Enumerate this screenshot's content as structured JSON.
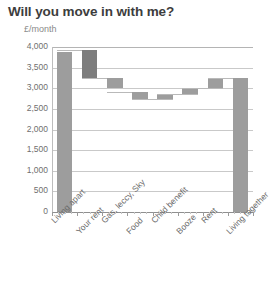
{
  "chart": {
    "title": "Will you move in with me?",
    "subtitle": "£/month"
  },
  "colors": {
    "bar": "#9d9d9d",
    "bar_highlight": "#7d7d7d",
    "gridline": "#c9c9c9",
    "axis": "#8f8f8f",
    "title_text": "#3d3d3d",
    "label_text": "#6b6b6b"
  },
  "chart_data": {
    "type": "bar",
    "subtype": "waterfall",
    "title": "Will you move in with me?",
    "subtitle": "£/month",
    "xlabel": "",
    "ylabel": "£/month",
    "ylim": [
      0,
      4000
    ],
    "ytick_labels": [
      "4,000",
      "3,500",
      "3,000",
      "2,500",
      "2,000",
      "1,500",
      "1,000",
      "500",
      "0"
    ],
    "ytick_values": [
      4000,
      3500,
      3000,
      2500,
      2000,
      1500,
      1000,
      500,
      0
    ],
    "grid": true,
    "legend": false,
    "categories": [
      "Living apart",
      "Your rent",
      "Gas, leccy, Sky",
      "Food",
      "Child benefit",
      "Booze",
      "Rent",
      "Living together"
    ],
    "bars": [
      {
        "label": "Living apart",
        "kind": "total",
        "base": 0,
        "top": 3870,
        "value": 3870,
        "highlight": false
      },
      {
        "label": "Your rent",
        "kind": "decrease",
        "base": 3250,
        "top": 3920,
        "value": -670,
        "highlight": true
      },
      {
        "label": "Gas, leccy, Sky",
        "kind": "decrease",
        "base": 3000,
        "top": 3250,
        "value": -250,
        "highlight": false
      },
      {
        "label": "Food",
        "kind": "decrease",
        "base": 2750,
        "top": 2900,
        "value": -150,
        "highlight": false
      },
      {
        "label": "Child benefit",
        "kind": "increase",
        "base": 2750,
        "top": 2870,
        "value": 120,
        "highlight": false
      },
      {
        "label": "Booze",
        "kind": "increase",
        "base": 2870,
        "top": 3000,
        "value": 130,
        "highlight": false
      },
      {
        "label": "Rent",
        "kind": "increase",
        "base": 3000,
        "top": 3250,
        "value": 250,
        "highlight": false
      },
      {
        "label": "Living together",
        "kind": "total",
        "base": 0,
        "top": 3250,
        "value": 3250,
        "highlight": false
      }
    ]
  }
}
